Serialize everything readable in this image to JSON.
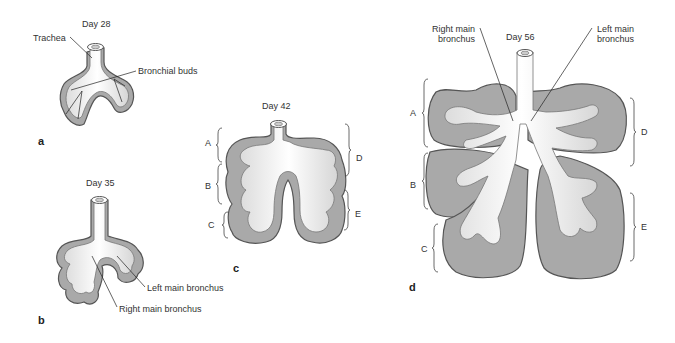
{
  "figure": {
    "panels": [
      {
        "id": "a",
        "letter": "a",
        "title": "Day 28",
        "labels": {
          "trachea": "Trachea",
          "bronchial_buds": "Bronchial buds"
        }
      },
      {
        "id": "b",
        "letter": "b",
        "title": "Day 35",
        "labels": {
          "left_main_bronchus": "Left main bronchus",
          "right_main_bronchus": "Right main bronchus"
        }
      },
      {
        "id": "c",
        "letter": "c",
        "title": "Day 42",
        "lobe_labels": [
          "A",
          "B",
          "C",
          "D",
          "E"
        ]
      },
      {
        "id": "d",
        "letter": "d",
        "title": "Day 56",
        "labels": {
          "right_main_bronchus": "Right main\nbronchus",
          "left_main_bronchus": "Left main\nbronchus"
        },
        "lobe_labels": [
          "A",
          "B",
          "C",
          "D",
          "E"
        ]
      }
    ],
    "colors": {
      "mesenchyme": "#a9a9a9",
      "epithelium": "#f7f7f7",
      "outline": "#555555",
      "leader": "#222222"
    }
  }
}
